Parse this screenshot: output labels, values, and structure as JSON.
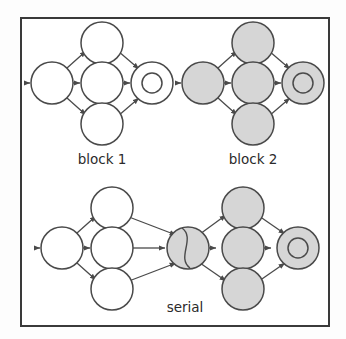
{
  "figure": {
    "background_color": "#fdfdfd",
    "frame_color": "#3a3a3a",
    "node_stroke_color": "#4a4a4a",
    "node_fill_empty": "#ffffff",
    "node_fill_marked": "#d6d6d6",
    "captions": {
      "block1": "block 1",
      "block2": "block 2",
      "serial": "serial"
    },
    "panels": [
      {
        "id": "block1",
        "label": "block 1",
        "marked": false,
        "nodes": [
          {
            "name": "block1-source-node",
            "shape": "circle",
            "fill": "empty",
            "cx": 52,
            "cy": 83,
            "r": 21
          },
          {
            "name": "block1-top-branch-node",
            "shape": "circle",
            "fill": "empty",
            "cx": 102,
            "cy": 43,
            "r": 21
          },
          {
            "name": "block1-middle-branch-node",
            "shape": "circle",
            "fill": "empty",
            "cx": 102,
            "cy": 83,
            "r": 21
          },
          {
            "name": "block1-bottom-branch-node",
            "shape": "circle",
            "fill": "empty",
            "cx": 102,
            "cy": 124,
            "r": 21
          },
          {
            "name": "block1-sink-node",
            "shape": "double-circle",
            "fill": "empty",
            "cx": 152,
            "cy": 83,
            "r": 21,
            "inner_r": 10
          }
        ]
      },
      {
        "id": "block2",
        "label": "block 2",
        "marked": true,
        "nodes": [
          {
            "name": "block2-source-node",
            "shape": "circle",
            "fill": "marked",
            "cx": 203,
            "cy": 83,
            "r": 21
          },
          {
            "name": "block2-top-branch-node",
            "shape": "circle",
            "fill": "marked",
            "cx": 253,
            "cy": 43,
            "r": 21
          },
          {
            "name": "block2-middle-branch-node",
            "shape": "circle",
            "fill": "marked",
            "cx": 253,
            "cy": 83,
            "r": 21
          },
          {
            "name": "block2-bottom-branch-node",
            "shape": "circle",
            "fill": "marked",
            "cx": 253,
            "cy": 124,
            "r": 21
          },
          {
            "name": "block2-sink-node",
            "shape": "double-circle",
            "fill": "marked",
            "cx": 303,
            "cy": 83,
            "r": 21,
            "inner_r": 10
          }
        ]
      },
      {
        "id": "serial",
        "label": "serial",
        "marked": "mixed",
        "nodes": [
          {
            "name": "serial-source-node",
            "shape": "circle",
            "fill": "empty",
            "cx": 62,
            "cy": 248,
            "r": 21
          },
          {
            "name": "serial-top-branch-node-left",
            "shape": "circle",
            "fill": "empty",
            "cx": 112,
            "cy": 208,
            "r": 21
          },
          {
            "name": "serial-middle-branch-node-left",
            "shape": "circle",
            "fill": "empty",
            "cx": 112,
            "cy": 248,
            "r": 21
          },
          {
            "name": "serial-bottom-branch-node-left",
            "shape": "circle",
            "fill": "empty",
            "cx": 112,
            "cy": 289,
            "r": 21
          },
          {
            "name": "serial-merge-node",
            "shape": "circle-s-curve",
            "fill": "marked",
            "cx": 188,
            "cy": 248,
            "r": 21
          },
          {
            "name": "serial-top-branch-node-right",
            "shape": "circle",
            "fill": "marked",
            "cx": 243,
            "cy": 208,
            "r": 21
          },
          {
            "name": "serial-middle-branch-node-right",
            "shape": "circle",
            "fill": "marked",
            "cx": 243,
            "cy": 248,
            "r": 21
          },
          {
            "name": "serial-bottom-branch-node-right",
            "shape": "circle",
            "fill": "marked",
            "cx": 243,
            "cy": 289,
            "r": 21
          },
          {
            "name": "serial-sink-node",
            "shape": "double-circle",
            "fill": "marked",
            "cx": 298,
            "cy": 248,
            "r": 21,
            "inner_r": 10
          }
        ]
      }
    ],
    "entry_arrows": [
      {
        "name": "block1-entry-arrow",
        "x1": 24,
        "y1": 83,
        "x2": 31,
        "y2": 83
      },
      {
        "name": "block2-entry-arrow",
        "x1": 175,
        "y1": 83,
        "x2": 182,
        "y2": 83
      },
      {
        "name": "serial-entry-arrow",
        "x1": 34,
        "y1": 248,
        "x2": 41,
        "y2": 248
      }
    ]
  }
}
